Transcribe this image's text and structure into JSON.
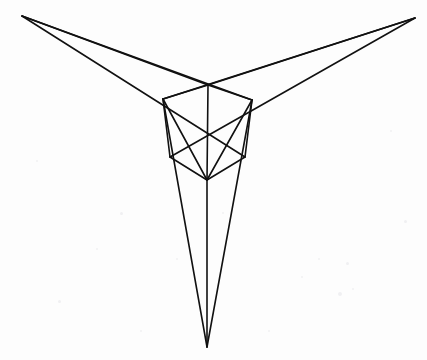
{
  "document": {
    "title": "Three-Point Perspective Cube Construction",
    "medium": "pencil-line-drawing-on-paper",
    "background_color": "#fdfdfd",
    "ink_color": "#111111",
    "width": 427,
    "height": 360
  },
  "drawing": {
    "type": "three-point-perspective-construction",
    "subject": "cube",
    "stroke_width": 1.6,
    "vanishing_points": [
      {
        "name": "left-vanishing-point",
        "label": "VP Left",
        "x": 22,
        "y": 16
      },
      {
        "name": "right-vanishing-point",
        "label": "VP Right",
        "x": 415,
        "y": 18
      },
      {
        "name": "bottom-vanishing-point",
        "label": "VP Bottom",
        "x": 207,
        "y": 347
      }
    ],
    "cube_vertices": [
      {
        "name": "top-back-corner",
        "x": 208,
        "y": 85
      },
      {
        "name": "top-left-corner",
        "x": 163,
        "y": 99
      },
      {
        "name": "top-right-corner",
        "x": 252,
        "y": 100
      },
      {
        "name": "front-bottom-corner",
        "x": 207,
        "y": 180
      },
      {
        "name": "bottom-left-corner",
        "x": 170,
        "y": 157
      },
      {
        "name": "bottom-right-corner",
        "x": 245,
        "y": 157
      }
    ],
    "cube_edges": [
      {
        "name": "top-face-edge-back-left",
        "x1": 208,
        "y1": 85,
        "x2": 163,
        "y2": 99
      },
      {
        "name": "top-face-edge-back-right",
        "x1": 208,
        "y1": 85,
        "x2": 252,
        "y2": 100
      },
      {
        "name": "top-face-edge-front-left",
        "x1": 163,
        "y1": 99,
        "x2": 207,
        "y2": 180
      },
      {
        "name": "top-face-edge-front-right",
        "x1": 252,
        "y1": 100,
        "x2": 207,
        "y2": 180
      },
      {
        "name": "vertical-edge-center",
        "x1": 208,
        "y1": 85,
        "x2": 207,
        "y2": 180
      },
      {
        "name": "vertical-edge-left",
        "x1": 163,
        "y1": 99,
        "x2": 170,
        "y2": 157
      },
      {
        "name": "vertical-edge-right",
        "x1": 252,
        "y1": 100,
        "x2": 245,
        "y2": 157
      },
      {
        "name": "bottom-edge-left",
        "x1": 170,
        "y1": 157,
        "x2": 207,
        "y2": 180
      },
      {
        "name": "bottom-edge-right",
        "x1": 245,
        "y1": 157,
        "x2": 207,
        "y2": 180
      }
    ],
    "construction_lines": [
      {
        "name": "left-vp-ray-to-top-back",
        "x1": 22,
        "y1": 16,
        "x2": 208,
        "y2": 85
      },
      {
        "name": "left-vp-ray-to-top-right",
        "x1": 22,
        "y1": 16,
        "x2": 252,
        "y2": 100
      },
      {
        "name": "left-vp-ray-to-bottom-right",
        "x1": 22,
        "y1": 16,
        "x2": 245,
        "y2": 157
      },
      {
        "name": "right-vp-ray-to-top-back",
        "x1": 415,
        "y1": 18,
        "x2": 208,
        "y2": 85
      },
      {
        "name": "right-vp-ray-to-top-left",
        "x1": 415,
        "y1": 18,
        "x2": 163,
        "y2": 99
      },
      {
        "name": "right-vp-ray-to-bottom-left",
        "x1": 415,
        "y1": 18,
        "x2": 170,
        "y2": 157
      },
      {
        "name": "bottom-vp-ray-from-top-left",
        "x1": 163,
        "y1": 99,
        "x2": 207,
        "y2": 347
      },
      {
        "name": "bottom-vp-ray-from-top-right",
        "x1": 252,
        "y1": 100,
        "x2": 207,
        "y2": 347
      },
      {
        "name": "bottom-vp-ray-from-front-corner",
        "x1": 207,
        "y1": 180,
        "x2": 207,
        "y2": 347
      }
    ],
    "specks": [
      {
        "x": 318,
        "y": 258,
        "s": 2
      },
      {
        "x": 346,
        "y": 262,
        "s": 3
      },
      {
        "x": 352,
        "y": 288,
        "s": 2
      },
      {
        "x": 301,
        "y": 276,
        "s": 2
      },
      {
        "x": 338,
        "y": 292,
        "s": 4
      },
      {
        "x": 120,
        "y": 212,
        "s": 3
      },
      {
        "x": 96,
        "y": 248,
        "s": 2
      },
      {
        "x": 58,
        "y": 300,
        "s": 3
      },
      {
        "x": 268,
        "y": 330,
        "s": 2
      },
      {
        "x": 176,
        "y": 258,
        "s": 2
      },
      {
        "x": 390,
        "y": 130,
        "s": 2
      },
      {
        "x": 36,
        "y": 160,
        "s": 2
      },
      {
        "x": 404,
        "y": 220,
        "s": 3
      },
      {
        "x": 140,
        "y": 330,
        "s": 2
      },
      {
        "x": 222,
        "y": 212,
        "s": 2
      }
    ]
  }
}
